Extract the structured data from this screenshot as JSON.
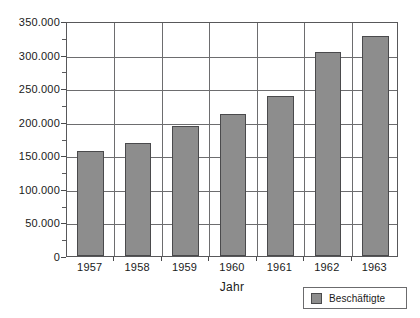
{
  "chart_data": {
    "type": "bar",
    "title": "",
    "xlabel": "Jahr",
    "ylabel": "",
    "categories": [
      "1957",
      "1958",
      "1959",
      "1960",
      "1961",
      "1962",
      "1963"
    ],
    "values": [
      157000,
      168000,
      194000,
      211000,
      238000,
      304000,
      328000
    ],
    "series": [
      {
        "name": "Beschäftigte",
        "values": [
          157000,
          168000,
          194000,
          211000,
          238000,
          304000,
          328000
        ]
      }
    ],
    "ylim": [
      0,
      350000
    ],
    "ytick_labels": [
      "0",
      "50.000",
      "100.000",
      "150.000",
      "200.000",
      "250.000",
      "300.000",
      "350.000"
    ],
    "ytick_values": [
      0,
      50000,
      100000,
      150000,
      200000,
      250000,
      300000,
      350000
    ],
    "grid": true,
    "legend_position": "bottom-right",
    "legend": [
      "Beschäftigte"
    ],
    "bar_color": "#8d8d8d",
    "bar_border_color": "#4a4a4c",
    "axis_color": "#58585a"
  },
  "legend": {
    "entry_label": "Beschäftigte"
  },
  "axis": {
    "x_title": "Jahr"
  },
  "artifact": {
    "clipped_caption": ""
  }
}
